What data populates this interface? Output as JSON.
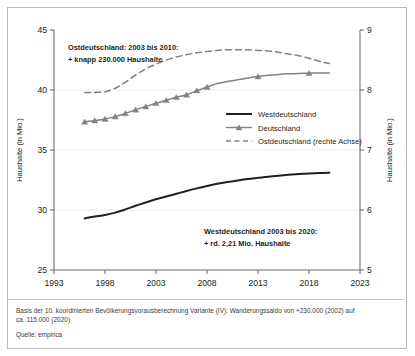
{
  "figure": {
    "title": "",
    "footnote_line1": "Basis der 10. koordinierten Bevölkerungsvorausberechnung Variante (IV): Wanderungssaldo von +230.000 (2002) auf",
    "footnote_line2": "ca. 115.000 (2020)",
    "source": "Quelle: empirica"
  },
  "annotations": {
    "ost_line1": "Ostdeutschland: 2003 bis 2010:",
    "ost_line2": "+ knapp 230.000 Haushalte",
    "west_line1": "Westdeutschland 2003 bis 2020:",
    "west_line2": "+ rd. 2,21 Mio. Haushalte"
  },
  "colors": {
    "west": "#231f20",
    "deutschland": "#808285",
    "ost": "#808285",
    "axis": "#6d6e71",
    "grid": "#c9c9c9",
    "frame": "#b9bcbe",
    "text": "#231f20"
  },
  "chart_data": {
    "type": "line",
    "title": "",
    "xlabel": "",
    "ylabel": "Haushalte (in Mio.)",
    "y2label": "Haushalte (in Mio.)",
    "xlim": [
      1993,
      2023
    ],
    "ylim": [
      25,
      45
    ],
    "y2lim": [
      5,
      9
    ],
    "xticks": [
      1993,
      1998,
      2003,
      2008,
      2013,
      2018,
      2023
    ],
    "yticks": [
      25,
      30,
      35,
      40,
      45
    ],
    "y2ticks": [
      5,
      6,
      7,
      8,
      9
    ],
    "grid": true,
    "grid_values": [
      30,
      35,
      40
    ],
    "legend_position": "center-right",
    "series": [
      {
        "name": "Westdeutschland",
        "axis": "left",
        "style": "solid",
        "marker": "none",
        "color": "#231f20",
        "x": [
          1996,
          1997,
          1998,
          1999,
          2000,
          2001,
          2002,
          2003,
          2004,
          2005,
          2006,
          2007,
          2008,
          2009,
          2010,
          2011,
          2012,
          2013,
          2014,
          2015,
          2016,
          2017,
          2018,
          2019,
          2020
        ],
        "values": [
          29.3,
          29.45,
          29.58,
          29.78,
          30.05,
          30.35,
          30.62,
          30.9,
          31.12,
          31.35,
          31.58,
          31.8,
          32.0,
          32.18,
          32.33,
          32.46,
          32.58,
          32.68,
          32.78,
          32.86,
          32.93,
          32.99,
          33.04,
          33.08,
          33.11
        ]
      },
      {
        "name": "Deutschland",
        "axis": "left",
        "style": "solid",
        "marker": "triangle",
        "color": "#808285",
        "x": [
          1996,
          1997,
          1998,
          1999,
          2000,
          2001,
          2002,
          2003,
          2004,
          2005,
          2006,
          2007,
          2008,
          2009,
          2010,
          2011,
          2012,
          2013,
          2014,
          2015,
          2016,
          2017,
          2018,
          2019,
          2020
        ],
        "values": [
          37.35,
          37.45,
          37.58,
          37.78,
          38.05,
          38.35,
          38.62,
          38.9,
          39.15,
          39.4,
          39.6,
          39.95,
          40.25,
          40.55,
          40.7,
          40.85,
          41.0,
          41.12,
          41.22,
          41.3,
          41.35,
          41.38,
          41.4,
          41.42,
          41.42
        ],
        "markers_x": [
          1996,
          1997,
          1998,
          1999,
          2000,
          2001,
          2002,
          2003,
          2004,
          2005,
          2006,
          2007,
          2008,
          2013,
          2018
        ]
      },
      {
        "name": "Ostdeutschland (rechte Achse)",
        "axis": "right",
        "style": "dashed",
        "marker": "none",
        "color": "#808285",
        "x": [
          1996,
          1997,
          1998,
          1999,
          2000,
          2001,
          2002,
          2003,
          2004,
          2005,
          2006,
          2007,
          2008,
          2009,
          2010,
          2011,
          2012,
          2013,
          2014,
          2015,
          2016,
          2017,
          2018,
          2019,
          2020
        ],
        "values": [
          7.96,
          7.96,
          7.97,
          8.03,
          8.13,
          8.25,
          8.35,
          8.43,
          8.5,
          8.55,
          8.59,
          8.62,
          8.64,
          8.66,
          8.67,
          8.67,
          8.67,
          8.66,
          8.65,
          8.63,
          8.6,
          8.57,
          8.53,
          8.48,
          8.44
        ]
      }
    ],
    "legend": [
      {
        "label": "Westdeutschland",
        "style": "solid",
        "marker": "none",
        "color": "#231f20"
      },
      {
        "label": "Deutschland",
        "style": "solid",
        "marker": "triangle",
        "color": "#808285"
      },
      {
        "label": "Ostdeutschland (rechte Achse)",
        "style": "dashed",
        "marker": "none",
        "color": "#808285"
      }
    ]
  }
}
